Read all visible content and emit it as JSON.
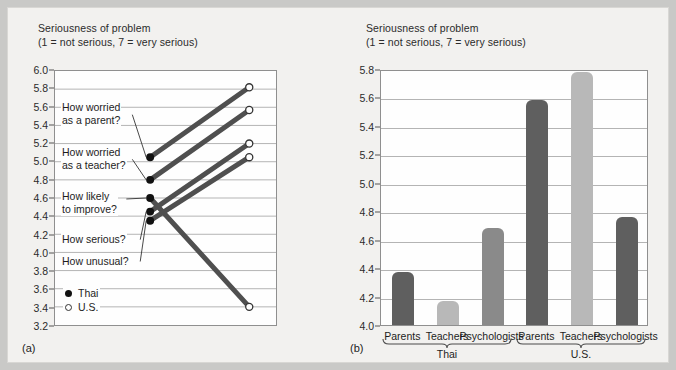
{
  "figure": {
    "panel_a_letter": "(a)",
    "panel_b_letter": "(b)"
  },
  "panel_a": {
    "axis_title": "Seriousness of problem\n(1 = not serious, 7 = very serious)",
    "y_ticks": [
      "6.0",
      "5.8",
      "5.6",
      "5.4",
      "5.2",
      "5.0",
      "4.8",
      "4.6",
      "4.4",
      "4.2",
      "4.0",
      "3.8",
      "3.6",
      "3.4",
      "3.2"
    ],
    "legend": [
      {
        "marker": "filled-dot",
        "label": "Thai"
      },
      {
        "marker": "open-dot",
        "label": "U.S."
      }
    ],
    "callouts": [
      {
        "text": "How worried\nas a parent?"
      },
      {
        "text": "How worried\nas a teacher?"
      },
      {
        "text": "How likely\nto improve?"
      },
      {
        "text": "How serious?"
      },
      {
        "text": "How unusual?"
      }
    ]
  },
  "panel_b": {
    "axis_title": "Seriousness of problem\n(1 = not serious, 7 = very serious)",
    "y_ticks": [
      "5.8",
      "5.6",
      "5.4",
      "5.2",
      "5.0",
      "4.8",
      "4.6",
      "4.4",
      "4.2",
      "4.0"
    ],
    "x_labels": [
      "Parents",
      "Teachers",
      "Psychologists",
      "Parents",
      "Teachers",
      "Psychologists"
    ],
    "group_labels": [
      "Thai",
      "U.S."
    ]
  },
  "colors": {
    "bar_dark": "#5f5f5f",
    "bar_light": "#b8b8b8",
    "slope_line": "#4f4f4f",
    "plot_background": "#fefefe",
    "figure_background": "#f2f1ef",
    "page_background": "#c9c9c7",
    "gridline": "#b4b4b4"
  },
  "chart_data": [
    {
      "type": "line",
      "title": "Seriousness of problem",
      "subtitle": "(1 = not serious, 7 = very serious)",
      "panel": "(a)",
      "xlabel": "",
      "ylabel": "Seriousness of problem",
      "ylim": [
        3.2,
        6.0
      ],
      "ytick_step": 0.2,
      "grid": true,
      "legend": [
        "Thai",
        "U.S."
      ],
      "legend_position": "inside-bottom-left",
      "categories": [
        "Thai",
        "U.S."
      ],
      "series": [
        {
          "name": "How worried as a parent?",
          "values": [
            5.05,
            5.82
          ]
        },
        {
          "name": "How worried as a teacher?",
          "values": [
            4.8,
            5.57
          ]
        },
        {
          "name": "How likely to improve?",
          "values": [
            4.6,
            3.4
          ]
        },
        {
          "name": "How serious?",
          "values": [
            4.45,
            5.2
          ]
        },
        {
          "name": "How unusual?",
          "values": [
            4.35,
            5.05
          ]
        }
      ]
    },
    {
      "type": "bar",
      "title": "Seriousness of problem",
      "subtitle": "(1 = not serious, 7 = very serious)",
      "panel": "(b)",
      "xlabel": "",
      "ylabel": "Seriousness of problem",
      "ylim": [
        4.0,
        5.8
      ],
      "ytick_step": 0.2,
      "grid": true,
      "categories": [
        "Parents",
        "Teachers",
        "Psychologists",
        "Parents",
        "Teachers",
        "Psychologists"
      ],
      "groups": [
        "Thai",
        "Thai",
        "Thai",
        "U.S.",
        "U.S.",
        "U.S."
      ],
      "values": [
        4.37,
        4.17,
        4.68,
        5.58,
        5.78,
        4.76
      ],
      "bar_colors": [
        "#5f5f5f",
        "#b8b8b8",
        "#8a8a8a",
        "#5f5f5f",
        "#b8b8b8",
        "#5f5f5f"
      ]
    }
  ]
}
